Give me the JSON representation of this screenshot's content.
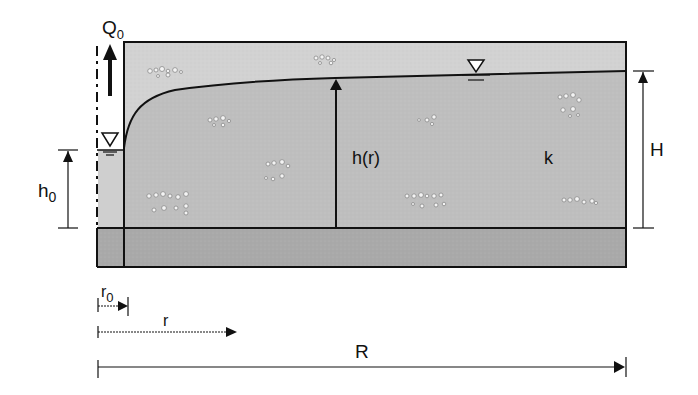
{
  "diagram": {
    "labels": {
      "discharge": "Q",
      "discharge_sub": "0",
      "well_head": "h",
      "well_head_sub": "0",
      "head_at_r": "h(r)",
      "conductivity": "k",
      "aquifer_thickness": "H",
      "well_radius": "r",
      "well_radius_sub": "0",
      "radial_distance": "r",
      "radius_of_influence": "R"
    },
    "symbols": {
      "water_table_marker": "▽"
    },
    "colors": {
      "unsaturated_zone": "#d2d2d2",
      "saturated_aquifer": "#bdbdbd",
      "impermeable_base": "#a9a9a9",
      "well_water": "#cccccc",
      "outline": "#111111"
    }
  }
}
